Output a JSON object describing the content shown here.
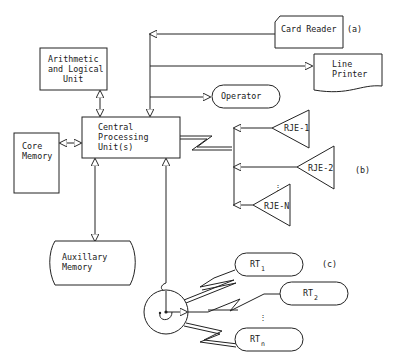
{
  "diagram": {
    "nodes": {
      "alu": {
        "line1": "Arithmetic",
        "line2": "and Logical",
        "line3": "Unit"
      },
      "cpu": {
        "line1": "Central",
        "line2": "Processing",
        "line3": "Unit(s)"
      },
      "core": {
        "line1": "Core",
        "line2": "Memory"
      },
      "aux": {
        "line1": "Auxillary",
        "line2": "Memory"
      },
      "card_reader": {
        "label": "Card Reader"
      },
      "line_printer": {
        "line1": "Line",
        "line2": "Printer"
      },
      "operator": {
        "label": "Operator"
      },
      "rje1": {
        "label": "RJE-1"
      },
      "rje2": {
        "label": "RJE-2"
      },
      "rjen": {
        "label": "RJE-N"
      },
      "rt1": {
        "base": "RT",
        "sub": "1"
      },
      "rt2": {
        "base": "RT",
        "sub": "2"
      },
      "rtn": {
        "base": "RT",
        "sub": "n"
      }
    },
    "group_labels": {
      "a": "(a)",
      "b": "(b)",
      "c": "(c)"
    },
    "ellipsis": "⋮"
  }
}
